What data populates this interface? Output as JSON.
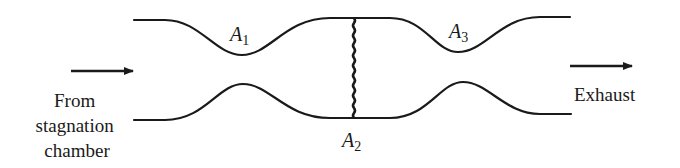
{
  "diagram": {
    "type": "supersonic wind tunnel with normal shock",
    "labels": {
      "inlet": [
        "From",
        "stagnation",
        "chamber"
      ],
      "outlet": "Exhaust",
      "area_1": {
        "main": "A",
        "sub": "1"
      },
      "area_2": {
        "main": "A",
        "sub": "2"
      },
      "area_3": {
        "main": "A",
        "sub": "3"
      }
    },
    "elements": [
      {
        "id": "first-throat",
        "label": "A1",
        "description": "nozzle throat"
      },
      {
        "id": "normal-shock",
        "label": "A2",
        "description": "normal shock in test section"
      },
      {
        "id": "second-throat",
        "label": "A3",
        "description": "diffuser throat"
      }
    ],
    "colors": {
      "ink": "#1a1a1a",
      "background": "#ffffff"
    }
  }
}
